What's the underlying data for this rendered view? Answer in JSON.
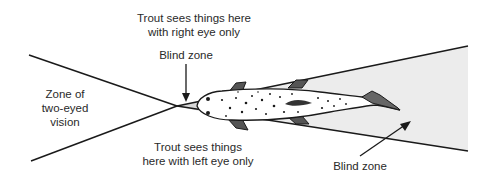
{
  "diagram": {
    "labels": {
      "right_eye": {
        "line1": "Trout sees things here",
        "line2": "with right eye only"
      },
      "blind_zone_front": "Blind zone",
      "two_eyed": {
        "line1": "Zone of",
        "line2": "two-eyed",
        "line3": "vision"
      },
      "left_eye": {
        "line1": "Trout sees things",
        "line2": "here with left eye only"
      },
      "blind_zone_rear": "Blind zone"
    },
    "colors": {
      "line": "#1a1a1a",
      "blind_zone_fill": "#ececec",
      "fish_outline": "#1a1a1a",
      "fish_body": "#ffffff",
      "text": "#2a2a2a"
    }
  }
}
